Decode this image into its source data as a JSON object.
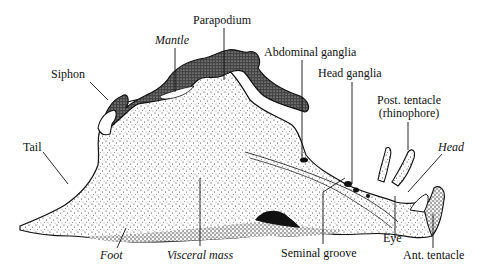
{
  "figure": {
    "ink_color": "#111111",
    "background": "#ffffff"
  },
  "labels": {
    "parapodium": "Parapodium",
    "mantle": "Mantle",
    "siphon": "Siphon",
    "abdominal_ganglia": "Abdominal ganglia",
    "head_ganglia": "Head ganglia",
    "post_tentacle_line1": "Post. tentacle",
    "post_tentacle_line2": "(rhinophore)",
    "head": "Head",
    "tail": "Tail",
    "foot": "Foot",
    "visceral_mass": "Visceral mass",
    "seminal_groove": "Seminal groove",
    "eye": "Eye",
    "ant_tentacle": "Ant. tentacle"
  }
}
